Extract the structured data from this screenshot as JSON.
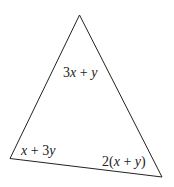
{
  "diagram": {
    "type": "triangle",
    "vertices": {
      "top": [
        79.5,
        15
      ],
      "bottom_left": [
        10,
        158.5
      ],
      "bottom_right": [
        162,
        177
      ]
    },
    "angle_labels": {
      "top": {
        "coef": "3",
        "var1": "x",
        "op": " + ",
        "var2": "y"
      },
      "bottom_left": {
        "var1": "x",
        "op": " + ",
        "coef": "3",
        "var2": "y"
      },
      "bottom_right": {
        "coef": "2(",
        "var1": "x",
        "op": " + ",
        "var2": "y",
        "close": ")"
      }
    },
    "colors": {
      "stroke": "#222222",
      "background": "#ffffff"
    }
  }
}
